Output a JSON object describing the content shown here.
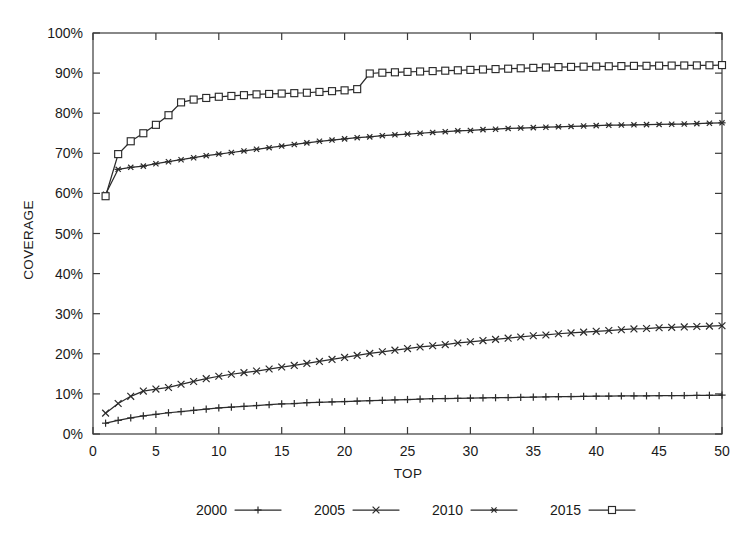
{
  "chart_data": {
    "type": "line",
    "title": "",
    "xlabel": "TOP",
    "ylabel": "COVERAGE",
    "xlim": [
      0,
      50
    ],
    "ylim": [
      0,
      100
    ],
    "grid": false,
    "legend_position": "bottom",
    "x_ticks": [
      "0",
      "5",
      "10",
      "15",
      "20",
      "25",
      "30",
      "35",
      "40",
      "45",
      "50"
    ],
    "x_tick_values": [
      0,
      5,
      10,
      15,
      20,
      25,
      30,
      35,
      40,
      45,
      50
    ],
    "y_ticks": [
      "0%",
      "10%",
      "20%",
      "30%",
      "40%",
      "50%",
      "60%",
      "70%",
      "80%",
      "90%",
      "100%"
    ],
    "y_tick_values": [
      0,
      10,
      20,
      30,
      40,
      50,
      60,
      70,
      80,
      90,
      100
    ],
    "x": [
      1,
      2,
      3,
      4,
      5,
      6,
      7,
      8,
      9,
      10,
      11,
      12,
      13,
      14,
      15,
      16,
      17,
      18,
      19,
      20,
      21,
      22,
      23,
      24,
      25,
      26,
      27,
      28,
      29,
      30,
      31,
      32,
      33,
      34,
      35,
      36,
      37,
      38,
      39,
      40,
      41,
      42,
      43,
      44,
      45,
      46,
      47,
      48,
      49,
      50
    ],
    "series": [
      {
        "name": "2000",
        "marker": "plus",
        "values": [
          2.7,
          3.4,
          4.0,
          4.5,
          4.9,
          5.3,
          5.6,
          5.9,
          6.2,
          6.5,
          6.7,
          6.9,
          7.1,
          7.3,
          7.5,
          7.6,
          7.8,
          7.9,
          8.0,
          8.1,
          8.2,
          8.3,
          8.4,
          8.5,
          8.6,
          8.7,
          8.8,
          8.85,
          8.9,
          8.95,
          9.0,
          9.05,
          9.1,
          9.15,
          9.2,
          9.25,
          9.3,
          9.35,
          9.4,
          9.42,
          9.45,
          9.48,
          9.5,
          9.52,
          9.55,
          9.58,
          9.6,
          9.62,
          9.65,
          9.7
        ]
      },
      {
        "name": "2005",
        "marker": "cross",
        "values": [
          5.2,
          7.6,
          9.4,
          10.7,
          11.2,
          11.6,
          12.4,
          13.1,
          13.8,
          14.4,
          14.9,
          15.3,
          15.7,
          16.2,
          16.7,
          17.1,
          17.6,
          18.1,
          18.6,
          19.1,
          19.6,
          20.1,
          20.5,
          20.9,
          21.3,
          21.7,
          22.0,
          22.3,
          22.7,
          23.0,
          23.3,
          23.6,
          23.9,
          24.2,
          24.5,
          24.7,
          25.0,
          25.2,
          25.4,
          25.6,
          25.8,
          26.0,
          26.2,
          26.3,
          26.5,
          26.6,
          26.7,
          26.8,
          26.9,
          27.0
        ]
      },
      {
        "name": "2010",
        "marker": "star",
        "values": [
          59.8,
          66.0,
          66.5,
          66.8,
          67.4,
          67.9,
          68.4,
          68.9,
          69.4,
          69.8,
          70.2,
          70.6,
          71.0,
          71.4,
          71.8,
          72.2,
          72.6,
          73.0,
          73.3,
          73.6,
          73.9,
          74.1,
          74.4,
          74.6,
          74.8,
          75.0,
          75.2,
          75.4,
          75.6,
          75.7,
          75.9,
          76.0,
          76.2,
          76.3,
          76.4,
          76.5,
          76.6,
          76.7,
          76.8,
          76.9,
          77.0,
          77.05,
          77.1,
          77.15,
          77.2,
          77.25,
          77.3,
          77.4,
          77.5,
          77.6
        ]
      },
      {
        "name": "2015",
        "marker": "square",
        "values": [
          59.3,
          69.8,
          73.0,
          75.0,
          77.1,
          79.5,
          82.7,
          83.4,
          83.8,
          84.1,
          84.3,
          84.5,
          84.7,
          84.8,
          84.9,
          85.0,
          85.1,
          85.3,
          85.5,
          85.7,
          86.0,
          89.9,
          90.1,
          90.2,
          90.3,
          90.4,
          90.5,
          90.6,
          90.7,
          90.8,
          90.9,
          91.0,
          91.1,
          91.2,
          91.3,
          91.4,
          91.5,
          91.55,
          91.6,
          91.65,
          91.7,
          91.75,
          91.8,
          91.82,
          91.85,
          91.88,
          91.9,
          91.92,
          91.95,
          92.0
        ]
      }
    ],
    "legend": [
      {
        "label": "2000",
        "marker": "plus"
      },
      {
        "label": "2005",
        "marker": "cross"
      },
      {
        "label": "2010",
        "marker": "star"
      },
      {
        "label": "2015",
        "marker": "square"
      }
    ]
  }
}
